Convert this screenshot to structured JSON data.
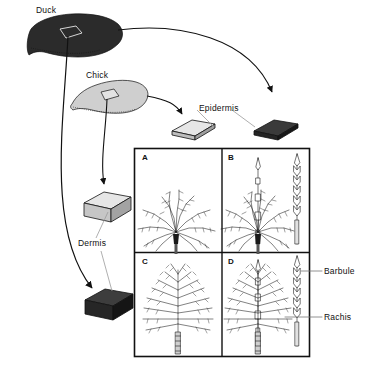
{
  "figure": {
    "type": "biology-diagram",
    "background_color": "#ffffff",
    "ink_color": "#111111",
    "duck_fill": "#2b2b2b",
    "chick_fill": "#cfcfcf"
  },
  "labels": {
    "duck": "Duck",
    "chick": "Chick",
    "epidermis": "Epidermis",
    "dermis": "Dermis",
    "barbule": "Barbule",
    "rachis": "Rachis"
  },
  "specimens": [
    {
      "id": "duck-skin",
      "label": "Duck",
      "tone": "dark"
    },
    {
      "id": "chick-skin",
      "label": "Chick",
      "tone": "light"
    }
  ],
  "tissue_blocks": [
    {
      "id": "epidermis-chick",
      "tissue": "Epidermis",
      "tone": "light",
      "shape": "thin-slab"
    },
    {
      "id": "epidermis-duck",
      "tissue": "Epidermis",
      "tone": "dark",
      "shape": "thin-slab"
    },
    {
      "id": "dermis-chick",
      "tissue": "Dermis",
      "tone": "light",
      "shape": "thick-block"
    },
    {
      "id": "dermis-duck",
      "tissue": "Dermis",
      "tone": "dark",
      "shape": "thick-block"
    }
  ],
  "panels": [
    {
      "letter": "A",
      "position": "top-left",
      "feather": "downy plume",
      "barb_detail": true
    },
    {
      "letter": "B",
      "position": "top-right",
      "feather": "downy plume",
      "barb_detail": true
    },
    {
      "letter": "C",
      "position": "bottom-left",
      "feather": "elongated plume",
      "barb_detail": true
    },
    {
      "letter": "D",
      "position": "bottom-right",
      "feather": "elongated plume",
      "barb_detail": true
    }
  ],
  "callouts": [
    {
      "text": "Barbule",
      "points_to": "barb-detail-D"
    },
    {
      "text": "Rachis",
      "points_to": "barb-detail-D"
    }
  ]
}
